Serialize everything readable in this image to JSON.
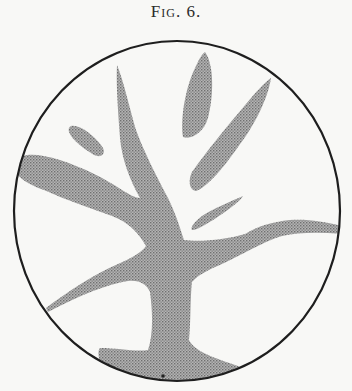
{
  "caption": "Fig. 6.",
  "figure": {
    "frame_shape": "circle",
    "colors": {
      "background": "#f8f8f6",
      "outline": "#1e1e1e",
      "shading": "#9c9c9c"
    }
  }
}
